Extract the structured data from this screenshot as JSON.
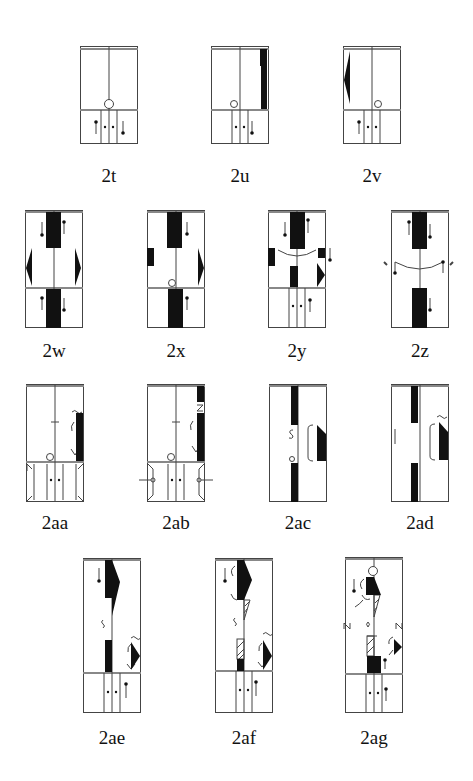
{
  "figures": [
    {
      "id": "2t",
      "label": "2t"
    },
    {
      "id": "2u",
      "label": "2u"
    },
    {
      "id": "2v",
      "label": "2v"
    },
    {
      "id": "2w",
      "label": "2w"
    },
    {
      "id": "2x",
      "label": "2x"
    },
    {
      "id": "2y",
      "label": "2y"
    },
    {
      "id": "2z",
      "label": "2z"
    },
    {
      "id": "2aa",
      "label": "2aa"
    },
    {
      "id": "2ab",
      "label": "2ab"
    },
    {
      "id": "2ac",
      "label": "2ac"
    },
    {
      "id": "2ad",
      "label": "2ad"
    },
    {
      "id": "2ae",
      "label": "2ae"
    },
    {
      "id": "2af",
      "label": "2af"
    },
    {
      "id": "2ag",
      "label": "2ag"
    }
  ],
  "colors": {
    "ink": "#111111",
    "frame": "#555555",
    "paper": "#ffffff"
  }
}
